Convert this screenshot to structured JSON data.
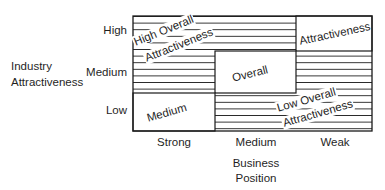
{
  "diagram": {
    "type": "matrix",
    "y_axis": {
      "title_line1": "Industry",
      "title_line2": "Attractiveness",
      "ticks": [
        "High",
        "Medium",
        "Low"
      ]
    },
    "x_axis": {
      "title_line1": "Business",
      "title_line2": "Position",
      "ticks": [
        "Strong",
        "Medium",
        "Weak"
      ]
    },
    "zones": {
      "high": {
        "line1": "High Overall",
        "line2": "Attractiveness"
      },
      "medium": {
        "top_right_label": "Attractiveness",
        "center_label": "Overall",
        "bottom_left_label": "Medium"
      },
      "low": {
        "line1": "Low Overall",
        "line2": "Attractiveness"
      }
    },
    "colors": {
      "line": "#1a1a1a",
      "background": "#ffffff"
    }
  }
}
